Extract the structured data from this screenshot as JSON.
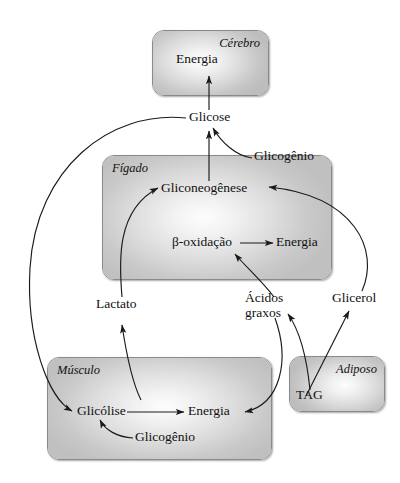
{
  "diagram": {
    "language": "pt-BR",
    "organs": [
      {
        "id": "brain",
        "label": "Cérebro",
        "nodes": [
          "Energia"
        ]
      },
      {
        "id": "liver",
        "label": "Fígado",
        "nodes": [
          "Gliconeogênese",
          "β-oxidação",
          "Energia"
        ]
      },
      {
        "id": "muscle",
        "label": "Músculo",
        "nodes": [
          "Glicólise",
          "Energia",
          "Glicogênio"
        ]
      },
      {
        "id": "adipose",
        "label": "Adiposo",
        "nodes": [
          "TAG"
        ]
      }
    ],
    "metabolites": {
      "glicose": "Glicose",
      "glicogenio_figado": "Glicogênio",
      "gliconeogenese": "Gliconeogênese",
      "beta_oxidacao": "β-oxidação",
      "energia_figado": "Energia",
      "lactato": "Lactato",
      "acidos_graxos_l1": "Ácidos",
      "acidos_graxos_l2": "graxos",
      "glicerol": "Glicerol",
      "glicolise": "Glicólise",
      "energia_musculo": "Energia",
      "glicogenio_musculo": "Glicogênio",
      "tag": "TAG",
      "energia_cerebro": "Energia"
    },
    "organ_labels": {
      "cerebro": "Cérebro",
      "figado": "Fígado",
      "musculo": "Músculo",
      "adiposo": "Adiposo"
    },
    "arrows": [
      {
        "from": "Glicose",
        "to": "Energia (Cérebro)"
      },
      {
        "from": "Gliconeogênese",
        "to": "Glicose"
      },
      {
        "from": "Glicogênio (Fígado)",
        "to": "Glicose"
      },
      {
        "from": "Lactato",
        "to": "Gliconeogênese"
      },
      {
        "from": "Glicerol",
        "to": "Gliconeogênese"
      },
      {
        "from": "β-oxidação",
        "to": "Energia (Fígado)"
      },
      {
        "from": "Ácidos graxos",
        "to": "β-oxidação"
      },
      {
        "from": "Glicose",
        "to": "Glicólise"
      },
      {
        "from": "Glicólise",
        "to": "Energia (Músculo)"
      },
      {
        "from": "Glicogênio (Músculo)",
        "to": "Glicólise"
      },
      {
        "from": "Glicólise",
        "to": "Lactato"
      },
      {
        "from": "TAG",
        "to": "Ácidos graxos"
      },
      {
        "from": "TAG",
        "to": "Glicerol"
      },
      {
        "from": "Ácidos graxos",
        "to": "Energia (Músculo)"
      }
    ],
    "colors": {
      "box_border": "#8a8a8a",
      "box_fill_center": "#fdfdfd",
      "box_fill_edge": "#c0c0c0",
      "line": "#1a1a1a",
      "background": "#ffffff"
    }
  }
}
